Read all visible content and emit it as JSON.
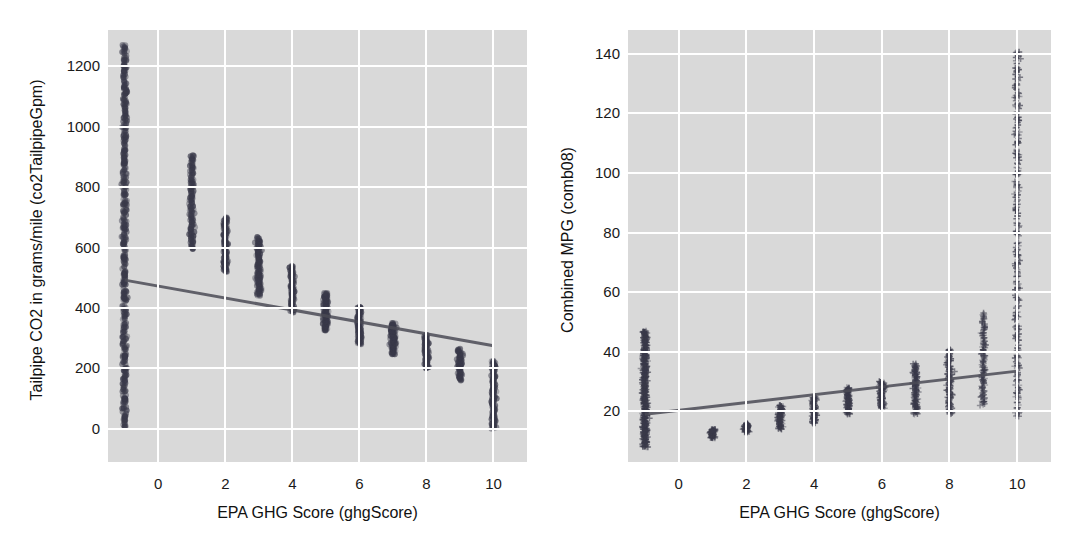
{
  "figure": {
    "background_color": "#ffffff",
    "panel_background_color": "#d9d9d9",
    "grid_color": "#ffffff",
    "marker_color": "#3a3a4a",
    "line_color": "#4a4a55"
  },
  "chart_data": [
    {
      "type": "scatter",
      "id": "co2-vs-ghgscore",
      "title": "",
      "xlabel": "EPA GHG Score (ghgScore)",
      "ylabel": "Tailpipe CO2 in grams/mile (co2TailpipeGpm)",
      "xlim": [
        -1.5,
        11.0
      ],
      "ylim": [
        -110,
        1320
      ],
      "xticks": [
        0,
        2,
        4,
        6,
        8,
        10
      ],
      "yticks": [
        0,
        200,
        400,
        600,
        800,
        1000,
        1200
      ],
      "grid": true,
      "legend": "none",
      "marker": "circle",
      "regression_line": {
        "x": [
          -1,
          10
        ],
        "y": [
          492,
          275
        ],
        "slope": -19.7,
        "intercept": 472.3
      },
      "series": [
        {
          "name": "vehicles",
          "columns": [
            {
              "x": -1,
              "y_min": 0,
              "y_max": 1270,
              "n": 420,
              "note": "unscored vehicles span full range"
            },
            {
              "x": 1,
              "y_min": 595,
              "y_max": 905,
              "n": 120
            },
            {
              "x": 2,
              "y_min": 520,
              "y_max": 700,
              "n": 110
            },
            {
              "x": 3,
              "y_min": 440,
              "y_max": 635,
              "n": 115
            },
            {
              "x": 4,
              "y_min": 385,
              "y_max": 540,
              "n": 105
            },
            {
              "x": 5,
              "y_min": 325,
              "y_max": 450,
              "n": 100
            },
            {
              "x": 6,
              "y_min": 280,
              "y_max": 405,
              "n": 95
            },
            {
              "x": 7,
              "y_min": 245,
              "y_max": 350,
              "n": 90
            },
            {
              "x": 8,
              "y_min": 200,
              "y_max": 310,
              "n": 85
            },
            {
              "x": 9,
              "y_min": 160,
              "y_max": 265,
              "n": 70
            },
            {
              "x": 10,
              "y_min": 0,
              "y_max": 225,
              "n": 130
            }
          ]
        }
      ]
    },
    {
      "type": "scatter",
      "id": "mpg-vs-ghgscore",
      "title": "",
      "xlabel": "EPA GHG Score (ghgScore)",
      "ylabel": "Combined MPG (comb08)",
      "xlim": [
        -1.5,
        11.0
      ],
      "ylim": [
        3,
        148
      ],
      "xticks": [
        0,
        2,
        4,
        6,
        8,
        10
      ],
      "yticks": [
        20,
        40,
        60,
        80,
        100,
        120,
        140
      ],
      "grid": true,
      "legend": "none",
      "marker": "plus",
      "regression_line": {
        "x": [
          -1,
          10
        ],
        "y": [
          19,
          33.5
        ],
        "slope": 1.32,
        "intercept": 20.32
      },
      "series": [
        {
          "name": "vehicles",
          "columns": [
            {
              "x": -1,
              "y_min": 8,
              "y_max": 47,
              "n": 420,
              "note": "unscored vehicles"
            },
            {
              "x": 1,
              "y_min": 11,
              "y_max": 14,
              "n": 60
            },
            {
              "x": 2,
              "y_min": 13,
              "y_max": 16,
              "n": 60
            },
            {
              "x": 3,
              "y_min": 14,
              "y_max": 22,
              "n": 80
            },
            {
              "x": 4,
              "y_min": 16,
              "y_max": 25,
              "n": 90
            },
            {
              "x": 5,
              "y_min": 19,
              "y_max": 28,
              "n": 90
            },
            {
              "x": 6,
              "y_min": 21,
              "y_max": 30,
              "n": 95
            },
            {
              "x": 7,
              "y_min": 19,
              "y_max": 36,
              "n": 110
            },
            {
              "x": 8,
              "y_min": 19,
              "y_max": 41,
              "n": 110
            },
            {
              "x": 9,
              "y_min": 22,
              "y_max": 53,
              "n": 100
            },
            {
              "x": 10,
              "y_min": 18,
              "y_max": 141,
              "n": 260
            }
          ]
        }
      ]
    }
  ],
  "panels": {
    "left": {
      "name": "co2-panel",
      "ylabel": "Tailpipe CO2 in grams/mile (co2TailpipeGpm)",
      "xlabel": "EPA GHG Score (ghgScore)",
      "yticks": [
        "1200",
        "1000",
        "800",
        "600",
        "400",
        "200",
        "0"
      ],
      "xticks": [
        "0",
        "2",
        "4",
        "6",
        "8",
        "10"
      ]
    },
    "right": {
      "name": "mpg-panel",
      "ylabel": "Combined MPG (comb08)",
      "xlabel": "EPA GHG Score (ghgScore)",
      "yticks": [
        "140",
        "120",
        "100",
        "80",
        "60",
        "40",
        "20"
      ],
      "xticks": [
        "0",
        "2",
        "4",
        "6",
        "8",
        "10"
      ]
    }
  }
}
